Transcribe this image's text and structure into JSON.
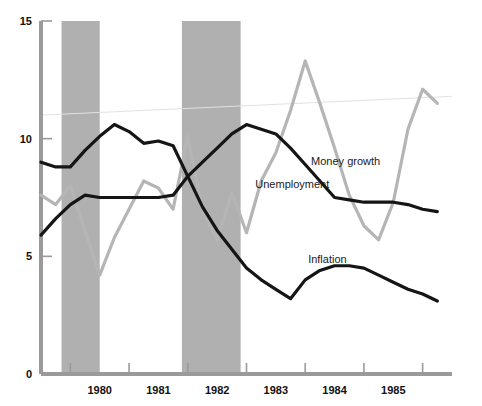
{
  "chart_data": {
    "type": "line",
    "title": "",
    "subtitle": "",
    "xlabel": "",
    "ylabel": "",
    "xlim": [
      1979.0,
      1986.0
    ],
    "ylim": [
      0,
      15
    ],
    "yticks": [
      0,
      5,
      10,
      15
    ],
    "ytick_labels": [
      "0",
      "5",
      "10",
      "15"
    ],
    "xticks": [
      1979.5,
      1980.5,
      1981.5,
      1982.5,
      1983.5,
      1984.5,
      1985.5
    ],
    "xtick_labels": [
      "",
      "1980",
      "1981",
      "1982",
      "1983",
      "1984",
      "1985"
    ],
    "x_axis_year_labels": [
      "1980",
      "1981",
      "1982",
      "1983",
      "1984",
      "1985"
    ],
    "grid": false,
    "legend_position": "inline-annotations",
    "x": [
      1979.0,
      1979.25,
      1979.5,
      1979.75,
      1980.0,
      1980.25,
      1980.5,
      1980.75,
      1981.0,
      1981.25,
      1981.5,
      1981.75,
      1982.0,
      1982.25,
      1982.5,
      1982.75,
      1983.0,
      1983.25,
      1983.5,
      1983.75,
      1984.0,
      1984.25,
      1984.5,
      1984.75,
      1985.0,
      1985.25,
      1985.5,
      1985.75
    ],
    "series": [
      {
        "name": "Unemployment",
        "color": "#151515",
        "line_width": 3.2,
        "label_x": 1982.65,
        "label_y": 7.9,
        "values": [
          5.9,
          6.6,
          7.2,
          7.6,
          7.5,
          7.5,
          7.5,
          7.5,
          7.5,
          7.6,
          8.4,
          9.0,
          9.6,
          10.2,
          10.6,
          10.4,
          10.2,
          9.6,
          8.9,
          8.2,
          7.5,
          7.4,
          7.3,
          7.3,
          7.3,
          7.2,
          7.0,
          6.9
        ]
      },
      {
        "name": "Inflation",
        "color": "#151515",
        "line_width": 3.2,
        "label_x": 1983.55,
        "label_y": 4.7,
        "values": [
          9.0,
          8.8,
          8.8,
          9.5,
          10.1,
          10.6,
          10.3,
          9.8,
          9.9,
          9.7,
          8.4,
          7.1,
          6.1,
          5.3,
          4.5,
          4.0,
          3.6,
          3.2,
          4.0,
          4.4,
          4.6,
          4.6,
          4.5,
          4.2,
          3.9,
          3.6,
          3.4,
          3.1
        ]
      },
      {
        "name": "Money growth",
        "color": "#b5b5b5",
        "line_width": 3.2,
        "label_x": 1983.6,
        "label_y": 8.9,
        "values": [
          7.6,
          7.2,
          8.0,
          6.1,
          4.2,
          5.8,
          7.0,
          8.2,
          7.9,
          7.0,
          10.1,
          7.0,
          5.7,
          7.7,
          6.0,
          8.2,
          9.4,
          11.2,
          13.3,
          11.5,
          9.6,
          7.6,
          6.3,
          5.7,
          7.3,
          10.4,
          12.1,
          11.5
        ]
      }
    ],
    "shaded_regions": [
      {
        "name": "recession-1980",
        "start": 1979.35,
        "end": 1980.0,
        "color": "#b0b0b0"
      },
      {
        "name": "recession-1981-82",
        "start": 1981.4,
        "end": 1982.4,
        "color": "#b0b0b0"
      }
    ],
    "trend_line": {
      "name": "faint-trend-line",
      "color": "#e2e2e2",
      "line_width": 1,
      "x_start": 1979.0,
      "y_start": 11.0,
      "x_end": 1986.0,
      "y_end": 11.8
    },
    "annotations": [
      {
        "text": "Money growth",
        "x": 1983.6,
        "y": 8.9
      },
      {
        "text": "Unemployment",
        "x": 1982.65,
        "y": 7.9
      },
      {
        "text": "Inflation",
        "x": 1983.55,
        "y": 4.7
      }
    ]
  },
  "axes": {
    "y_label_0": "0",
    "y_label_5": "5",
    "y_label_10": "10",
    "y_label_15": "15",
    "axis_color": "#9a9a9a"
  }
}
